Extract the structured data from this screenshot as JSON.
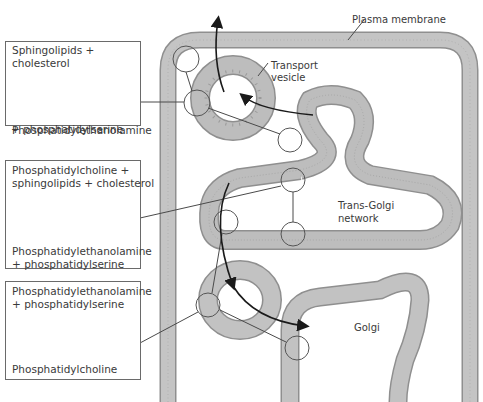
{
  "diagram": {
    "labels": {
      "plasma_membrane": "Plasma membrane",
      "transport_vesicle_line1": "Transport",
      "transport_vesicle_line2": "vesicle",
      "trans_golgi_line1": "Trans-Golgi",
      "trans_golgi_line2": "network",
      "golgi": "Golgi"
    },
    "panels": [
      {
        "top_line1": "Sphingolipids +",
        "top_line2": "cholesterol",
        "bottom_line1": "Phosphatidylethanolamine",
        "bottom_line2": "+ phosphatidylserine"
      },
      {
        "top_line1": "Phosphatidylcholine +",
        "top_line2": "sphingolipids + cholesterol",
        "bottom_line1": "Phosphatidylethanolamine",
        "bottom_line2": "+ phosphatidylserine"
      },
      {
        "top_line1": "Phosphatidylethanolamine",
        "top_line2": "+ phosphatidylserine",
        "bottom_line1": "Phosphatidylcholine"
      }
    ],
    "colors": {
      "membrane_fill": "#b9b9b9",
      "membrane_edge": "#8f8f8f",
      "line": "#4a4a4a",
      "arrow": "#1a1a1a"
    }
  }
}
